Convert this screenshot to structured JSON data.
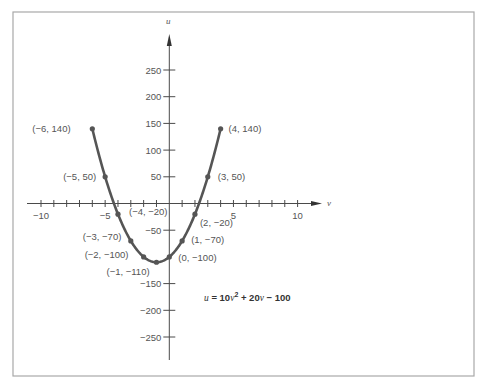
{
  "chart_data": {
    "type": "line",
    "title": "",
    "xlabel": "v",
    "ylabel": "u",
    "xlim": [
      -10,
      10
    ],
    "ylim": [
      -250,
      250
    ],
    "grid": false,
    "legend": null,
    "x_ticks": [
      -10,
      -9,
      -8,
      -7,
      -6,
      -5,
      -4,
      -3,
      -2,
      -1,
      1,
      2,
      3,
      4,
      5,
      6,
      7,
      8,
      9,
      10
    ],
    "x_tick_labels": [
      {
        "value": -10,
        "label": "−10"
      },
      {
        "value": -5,
        "label": "−5"
      },
      {
        "value": 5,
        "label": "5"
      },
      {
        "value": 10,
        "label": "10"
      }
    ],
    "y_ticks": [
      {
        "value": 250,
        "label": "250"
      },
      {
        "value": 200,
        "label": "200"
      },
      {
        "value": 150,
        "label": "150"
      },
      {
        "value": 100,
        "label": "100"
      },
      {
        "value": 50,
        "label": "50"
      },
      {
        "value": -50,
        "label": "−50"
      },
      {
        "value": -150,
        "label": "−150"
      },
      {
        "value": -200,
        "label": "−200"
      },
      {
        "value": -250,
        "label": "−250"
      }
    ],
    "series": [
      {
        "name": "u = 10v^2 + 20v − 100",
        "x": [
          -6,
          -5,
          -4,
          -3,
          -2,
          -1,
          0,
          1,
          2,
          3,
          4
        ],
        "y": [
          140,
          50,
          -20,
          -70,
          -100,
          -110,
          -100,
          -70,
          -20,
          50,
          140
        ]
      }
    ],
    "point_labels": [
      {
        "x": -6,
        "y": 140,
        "label": "(−6, 140)",
        "dx": -60,
        "dy": 3
      },
      {
        "x": -5,
        "y": 50,
        "label": "(−5, 50)",
        "dx": -42,
        "dy": 3
      },
      {
        "x": -4,
        "y": -20,
        "label": "(−4, −20)",
        "dx": 11,
        "dy": 1
      },
      {
        "x": -3,
        "y": -70,
        "label": "(−3, −70)",
        "dx": -48,
        "dy": -1
      },
      {
        "x": -2,
        "y": -100,
        "label": "(−2, −100)",
        "dx": -59,
        "dy": 1
      },
      {
        "x": -1,
        "y": -110,
        "label": "(−1, −110)",
        "dx": -50,
        "dy": 13
      },
      {
        "x": 0,
        "y": -100,
        "label": "(0, −100)",
        "dx": 9,
        "dy": 4
      },
      {
        "x": 1,
        "y": -70,
        "label": "(1, −70)",
        "dx": 9,
        "dy": 2
      },
      {
        "x": 2,
        "y": -20,
        "label": "(2, −20)",
        "dx": 5,
        "dy": 12
      },
      {
        "x": 3,
        "y": 50,
        "label": "(3, 50)",
        "dx": 10,
        "dy": 3
      },
      {
        "x": 4,
        "y": 140,
        "label": "(4, 140)",
        "dx": 8,
        "dy": 3
      }
    ],
    "annotations": [
      {
        "text": "u = 10v² + 20v − 100",
        "position": "lower-right of vertex"
      }
    ]
  },
  "equation": {
    "lhs_var": "u",
    "eq": " = 10",
    "var1": "v",
    "sup": "2",
    "plus": " + 20",
    "var2": "v",
    "tail": " − 100"
  },
  "axes": {
    "x_name": "v",
    "y_name": "u"
  }
}
